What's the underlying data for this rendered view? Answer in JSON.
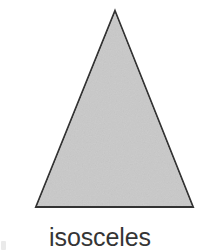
{
  "figure": {
    "caption": "isosceles",
    "background_color": "#ffffff",
    "caption_color": "#353535"
  },
  "shape": {
    "name": "triangle",
    "kind": "isosceles",
    "fill_color": "#c9c9c9",
    "stroke_color": "#333333",
    "stroke_width": 2,
    "vertices": [
      {
        "label": "apex",
        "x": 115,
        "y": 11
      },
      {
        "label": "base-right",
        "x": 193,
        "y": 207
      },
      {
        "label": "base-left",
        "x": 36,
        "y": 207
      }
    ]
  },
  "artifacts": {
    "smudge_color": "#d8d8d8"
  }
}
